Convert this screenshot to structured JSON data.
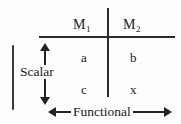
{
  "figure": {
    "background_color": "#fdfdfd",
    "ink_color": "#232323"
  },
  "matrix": {
    "column_headers": [
      {
        "text": "M",
        "subscript": "1",
        "name": "column-header-m1"
      },
      {
        "text": "M",
        "subscript": "2",
        "name": "column-header-m2"
      }
    ],
    "cells": [
      {
        "value": "a",
        "row": 0,
        "col": 0
      },
      {
        "value": "b",
        "row": 0,
        "col": 1
      },
      {
        "value": "c",
        "row": 1,
        "col": 0
      },
      {
        "value": "x",
        "row": 1,
        "col": 1
      }
    ]
  },
  "axes": {
    "vertical": {
      "label": "Scalar",
      "arrow": "double-headed",
      "orientation": "vertical"
    },
    "horizontal": {
      "label": "Functional",
      "arrow": "double-headed",
      "orientation": "horizontal"
    }
  },
  "marks": {
    "left_tick": "vertical-bar"
  }
}
